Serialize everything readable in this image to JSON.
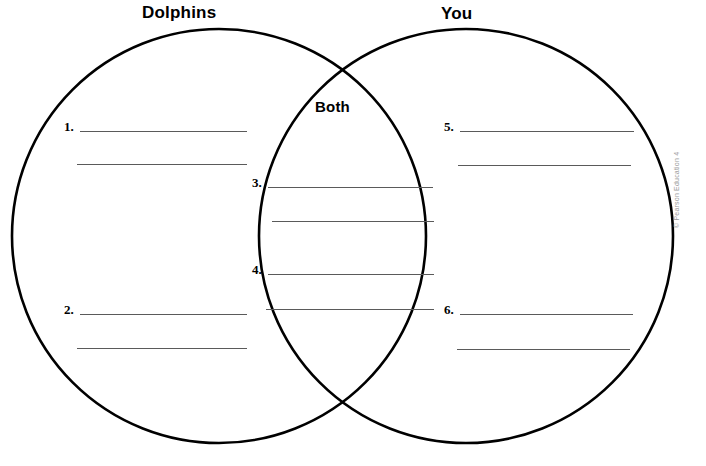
{
  "page": {
    "width": 706,
    "height": 466,
    "background_color": "#ffffff",
    "stroke_color": "#000000",
    "rule_color": "#5a5a5a"
  },
  "diagram": {
    "type": "venn-two-circle",
    "left_circle": {
      "label": "Dolphins",
      "cx": 219,
      "cy": 236,
      "r": 207
    },
    "right_circle": {
      "label": "You",
      "cx": 466,
      "cy": 236,
      "r": 207
    },
    "intersection": {
      "label": "Both",
      "top_point_x": 343,
      "top_point_y": 63,
      "bottom_point_x": 343,
      "bottom_point_y": 415
    }
  },
  "slots": [
    {
      "number": "1.",
      "region": "left",
      "lines": 2
    },
    {
      "number": "2.",
      "region": "left",
      "lines": 2
    },
    {
      "number": "3.",
      "region": "both",
      "lines": 2
    },
    {
      "number": "4.",
      "region": "both",
      "lines": 2
    },
    {
      "number": "5.",
      "region": "right",
      "lines": 2
    },
    {
      "number": "6.",
      "region": "right",
      "lines": 2
    }
  ],
  "credit": {
    "text": "© Pearson Education 4"
  }
}
